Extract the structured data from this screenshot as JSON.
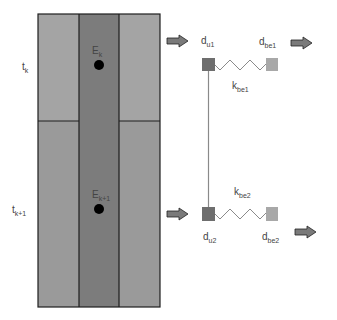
{
  "colors": {
    "outer_top": "#a4a4a4",
    "outer_bottom": "#9a9a9a",
    "center_column": "#7c7c7c",
    "border": "#1e1e1e",
    "dot": "#000000",
    "square_u": "#6e6e6e",
    "square_be": "#a8a8a8",
    "connector": "#8a8a8a",
    "arrow_fill": "#7a7a7a",
    "arrow_stroke": "#222222"
  },
  "rows": [
    {
      "time_label": {
        "main": "t",
        "sub": "k"
      },
      "node_label": {
        "main": "E",
        "sub": "k"
      }
    },
    {
      "time_label": {
        "main": "t",
        "sub": "k+1"
      },
      "node_label": {
        "main": "E",
        "sub": "k+1"
      }
    }
  ],
  "springs": [
    {
      "upper_node": {
        "main": "d",
        "sub": "u1"
      },
      "be_node": {
        "main": "d",
        "sub": "be1"
      },
      "stiffness": {
        "main": "k",
        "sub": "be1"
      }
    },
    {
      "upper_node": {
        "main": "d",
        "sub": "u2"
      },
      "be_node": {
        "main": "d",
        "sub": "be2"
      },
      "stiffness": {
        "main": "k",
        "sub": "be2"
      }
    }
  ]
}
